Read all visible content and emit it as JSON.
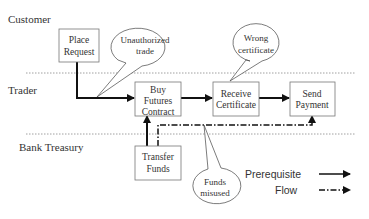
{
  "lanes": [
    {
      "label": "Customer"
    },
    {
      "label": "Trader"
    },
    {
      "label": "Bank Treasury"
    }
  ],
  "boxes": {
    "place_request": {
      "line1": "Place",
      "line2": "Request"
    },
    "buy_futures": {
      "line1": "Buy",
      "line2": "Futures",
      "line3": "Contract"
    },
    "receive_cert": {
      "line1": "Receive",
      "line2": "Certificate"
    },
    "send_payment": {
      "line1": "Send",
      "line2": "Payment"
    },
    "transfer_funds": {
      "line1": "Transfer",
      "line2": "Funds"
    }
  },
  "callouts": {
    "unauthorized": {
      "line1": "Unauthorized",
      "line2": "trade"
    },
    "wrong_cert": {
      "line1": "Wrong",
      "line2": "certificate"
    },
    "funds_misused": {
      "line1": "Funds",
      "line2": "misused"
    }
  },
  "legend": {
    "prerequisite": "Prerequisite",
    "flow": "Flow"
  },
  "colors": {
    "line": "#111111",
    "box_border": "#777777",
    "lane_divider": "#888888"
  }
}
